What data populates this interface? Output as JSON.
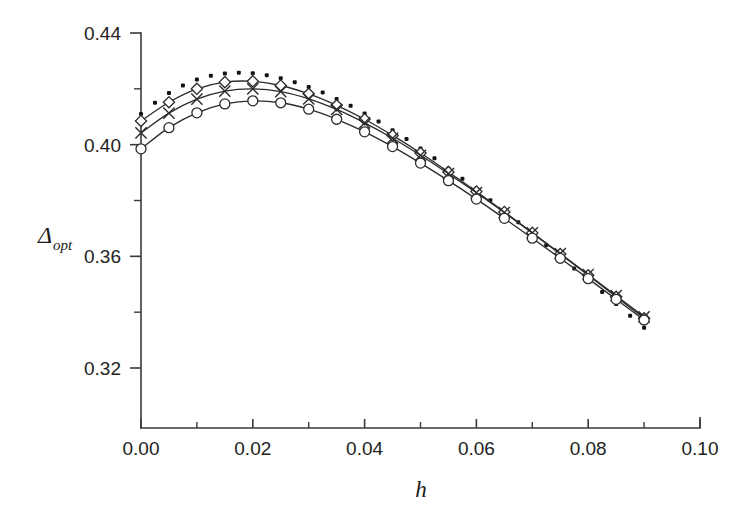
{
  "chart_data": {
    "type": "line",
    "title": "",
    "subtitle": "",
    "xlabel": "h",
    "ylabel": "Δ_opt",
    "ylabel_base": "Δ",
    "ylabel_sub": "opt",
    "xlim": [
      0.0,
      0.1
    ],
    "ylim": [
      0.3,
      0.45
    ],
    "grid": false,
    "legend": "none",
    "x_ticks": [
      0.0,
      0.02,
      0.04,
      0.06,
      0.08,
      0.1
    ],
    "x_tick_labels": [
      "0.00",
      "0.02",
      "0.04",
      "0.06",
      "0.08",
      "0.10"
    ],
    "x_minor_ticks": [
      0.01,
      0.03,
      0.05,
      0.07,
      0.09
    ],
    "y_ticks": [
      0.32,
      0.36,
      0.4,
      0.44
    ],
    "y_tick_labels": [
      "0.32",
      "0.36",
      "0.40",
      "0.44"
    ],
    "y_minor_ticks": [
      0.34,
      0.38,
      0.42
    ],
    "y_axis_bottom": 0.302,
    "y_axis_top": 0.44,
    "series": [
      {
        "name": "series-dotted",
        "marker": "filled-square",
        "line": "none",
        "x": [
          0.0,
          0.0025,
          0.005,
          0.0075,
          0.01,
          0.0125,
          0.015,
          0.0175,
          0.02,
          0.0225,
          0.025,
          0.0275,
          0.03,
          0.0325,
          0.035,
          0.0375,
          0.04,
          0.0425,
          0.045,
          0.0475,
          0.05,
          0.0525,
          0.055,
          0.0575,
          0.06,
          0.0625,
          0.065,
          0.0675,
          0.07,
          0.0725,
          0.075,
          0.0775,
          0.08,
          0.0825,
          0.085,
          0.0875,
          0.09
        ],
        "y": [
          0.411,
          0.415,
          0.4185,
          0.4212,
          0.4233,
          0.4247,
          0.4255,
          0.4258,
          0.4256,
          0.4249,
          0.4238,
          0.4224,
          0.4207,
          0.4187,
          0.4164,
          0.4139,
          0.4112,
          0.4083,
          0.4052,
          0.402,
          0.3986,
          0.3951,
          0.3915,
          0.3878,
          0.384,
          0.3801,
          0.3762,
          0.3722,
          0.3681,
          0.364,
          0.3598,
          0.3556,
          0.3514,
          0.3472,
          0.3429,
          0.3387,
          0.3344
        ]
      },
      {
        "name": "series-diamond",
        "marker": "diamond",
        "line": "solid",
        "x": [
          0.0,
          0.005,
          0.01,
          0.015,
          0.02,
          0.025,
          0.03,
          0.035,
          0.04,
          0.045,
          0.05,
          0.055,
          0.06,
          0.065,
          0.07,
          0.075,
          0.08,
          0.085,
          0.09
        ],
        "y": [
          0.4085,
          0.4152,
          0.42,
          0.4224,
          0.4227,
          0.4212,
          0.4182,
          0.4141,
          0.4091,
          0.4033,
          0.397,
          0.3902,
          0.3832,
          0.3759,
          0.3684,
          0.3608,
          0.3532,
          0.3455,
          0.3378
        ]
      },
      {
        "name": "series-cross",
        "marker": "x",
        "line": "solid",
        "x": [
          0.0,
          0.005,
          0.01,
          0.015,
          0.02,
          0.025,
          0.03,
          0.035,
          0.04,
          0.045,
          0.05,
          0.055,
          0.06,
          0.065,
          0.07,
          0.075,
          0.08,
          0.085,
          0.09
        ],
        "y": [
          0.4042,
          0.4113,
          0.4163,
          0.4192,
          0.42,
          0.419,
          0.4164,
          0.4126,
          0.4078,
          0.4023,
          0.3962,
          0.3896,
          0.3828,
          0.3757,
          0.3684,
          0.361,
          0.3535,
          0.3459,
          0.3383
        ]
      },
      {
        "name": "series-circle",
        "marker": "circle",
        "line": "solid",
        "x": [
          0.0,
          0.005,
          0.01,
          0.015,
          0.02,
          0.025,
          0.03,
          0.035,
          0.04,
          0.045,
          0.05,
          0.055,
          0.06,
          0.065,
          0.07,
          0.075,
          0.08,
          0.085,
          0.09
        ],
        "y": [
          0.3985,
          0.4061,
          0.4114,
          0.4146,
          0.4157,
          0.415,
          0.4127,
          0.4091,
          0.4046,
          0.3993,
          0.3934,
          0.3871,
          0.3805,
          0.3736,
          0.3665,
          0.3593,
          0.352,
          0.3446,
          0.3372
        ]
      }
    ],
    "colors": {
      "axis": "#3a3a3a",
      "line": "#2b2b2b",
      "marker_fill": "#ffffff",
      "marker_dot": "#141414",
      "background": "#ffffff"
    }
  }
}
